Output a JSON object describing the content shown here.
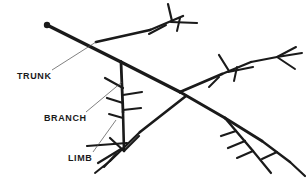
{
  "figure": {
    "type": "labeled-line-diagram",
    "background_color": "#ffffff",
    "stroke_color": "#1a1a1a",
    "width": 306,
    "height": 192
  },
  "labels": [
    {
      "id": "trunk",
      "text": "TRUNK",
      "text_x": 17,
      "text_y": 76,
      "leader_from_x": 52,
      "leader_from_y": 70,
      "leader_to_x": 96,
      "leader_to_y": 42
    },
    {
      "id": "branch",
      "text": "BRANCH",
      "text_x": 44,
      "text_y": 118,
      "leader_from_x": 86,
      "leader_from_y": 112,
      "leader_to_x": 122,
      "leader_to_y": 82
    },
    {
      "id": "limb",
      "text": "LIMB",
      "text_x": 68,
      "text_y": 158,
      "leader_from_x": 93,
      "leader_from_y": 152,
      "leader_to_x": 116,
      "leader_to_y": 120
    }
  ],
  "tree_structure": {
    "trunk_base_dot": {
      "x": 47,
      "y": 25,
      "r": 3.2
    },
    "trunk_path": "M47,25 L121,62 L180,92 L225,118 L262,141",
    "trunk_widths": [
      3.4,
      3.0,
      2.6
    ],
    "limbs": [
      {
        "name": "upper-left-limb",
        "path": "M96,42 L150,30 L183,16",
        "width": 2.6,
        "twigs": [
          "M172,21 L168,5",
          "M172,21 L196,22",
          "M166,24 L150,33",
          "M179,18 L176,30"
        ]
      },
      {
        "name": "vertical-limb",
        "path": "M121,62 L123,112 L124,150",
        "width": 2.8,
        "twigs": [
          "M123,88 L106,79",
          "M123,95 L141,92",
          "M123,103 L108,99",
          "M123,110 L140,108",
          "M123,118 L110,115",
          "M124,150 L111,139",
          "M124,150 L138,137"
        ]
      },
      {
        "name": "right-upper-limb",
        "path": "M180,92 L222,74 L250,62",
        "width": 2.6,
        "twigs": [
          "M228,71 L218,56",
          "M228,71 L252,68",
          "M236,68 L233,80",
          "M219,76 L210,86"
        ]
      },
      {
        "name": "lower-left-limb",
        "path": "M186,96 L140,132 L110,160",
        "width": 2.6,
        "twigs": [
          "M126,144 L88,146",
          "M120,150 L99,163",
          "M117,153 L105,166",
          "M110,160 L96,172"
        ]
      },
      {
        "name": "right-lower-limb",
        "path": "M225,118 L253,150 L272,172",
        "width": 2.4,
        "twigs": [
          "M236,131 L222,136",
          "M244,140 L229,147",
          "M253,150 L238,157"
        ]
      },
      {
        "name": "right-edge-limb",
        "path": "M250,62 L276,58 L300,54",
        "width": 2.2,
        "twigs": [
          "M276,58 L295,48",
          "M276,58 L294,68"
        ]
      },
      {
        "name": "far-right-lower-limb",
        "path": "M262,141 L290,162 L305,176",
        "width": 2.2,
        "twigs": [
          "M276,152 L262,158"
        ]
      }
    ]
  }
}
